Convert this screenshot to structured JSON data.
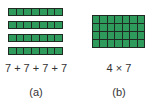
{
  "panels": [
    {
      "id": "a",
      "representation": "repeated-addition",
      "rows": 4,
      "columns": 7,
      "expression": "7 + 7 + 7 + 7",
      "label": "(a)"
    },
    {
      "id": "b",
      "representation": "array",
      "rows": 4,
      "columns": 7,
      "expression": "4 × 7",
      "label": "(b)"
    }
  ],
  "colors": {
    "cell_fill": "#2e9a5c",
    "cell_border": "#1f2a22",
    "text": "#333333"
  }
}
